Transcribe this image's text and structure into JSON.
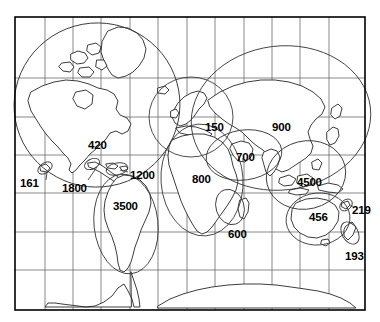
{
  "figure": {
    "kind": "world-map",
    "background_color": "#ffffff",
    "border_color": "#000000",
    "graticule_color": "#6b6b6b",
    "coastline_color": "#1a1a1a",
    "region_outline_color": "#3a3a3a",
    "label_color": "#000000",
    "frame": {
      "x": 15,
      "y": 17,
      "width": 350,
      "height": 293
    }
  },
  "graticule": {
    "meridians_x": [
      45,
      73,
      101,
      130,
      158,
      187,
      215,
      244,
      272,
      300,
      329
    ],
    "parallels_y": [
      78,
      117,
      155,
      193,
      232,
      270
    ]
  },
  "regions": [
    {
      "id": "north-america",
      "name": "North America",
      "value": "420",
      "label_x": 88,
      "label_y": 140
    },
    {
      "id": "hawaii",
      "name": "Hawaii",
      "value": "161",
      "label_x": 20,
      "label_y": 178
    },
    {
      "id": "central-america",
      "name": "Central America",
      "value": "1800",
      "label_x": 62,
      "label_y": 183
    },
    {
      "id": "caribbean",
      "name": "Caribbean",
      "value": "1200",
      "label_x": 130,
      "label_y": 170
    },
    {
      "id": "south-america",
      "name": "South America",
      "value": "3500",
      "label_x": 113,
      "label_y": 201
    },
    {
      "id": "europe",
      "name": "Europe",
      "value": "150",
      "label_x": 205,
      "label_y": 122
    },
    {
      "id": "africa",
      "name": "Africa",
      "value": "800",
      "label_x": 192,
      "label_y": 174
    },
    {
      "id": "southern-africa",
      "name": "Southern Africa",
      "value": "600",
      "label_x": 228,
      "label_y": 229
    },
    {
      "id": "middle-east",
      "name": "Middle East",
      "value": "700",
      "label_x": 236,
      "label_y": 152
    },
    {
      "id": "asia-north",
      "name": "Northern Asia",
      "value": "900",
      "label_x": 272,
      "label_y": 122
    },
    {
      "id": "southeast-asia",
      "name": "Southeast Asia",
      "value": "4500",
      "label_x": 297,
      "label_y": 177
    },
    {
      "id": "australia",
      "name": "Australia",
      "value": "456",
      "label_x": 309,
      "label_y": 212
    },
    {
      "id": "new-caledonia",
      "name": "New Caledonia",
      "value": "219",
      "label_x": 352,
      "label_y": 205
    },
    {
      "id": "new-zealand",
      "name": "New Zealand",
      "value": "193",
      "label_x": 345,
      "label_y": 251
    }
  ]
}
